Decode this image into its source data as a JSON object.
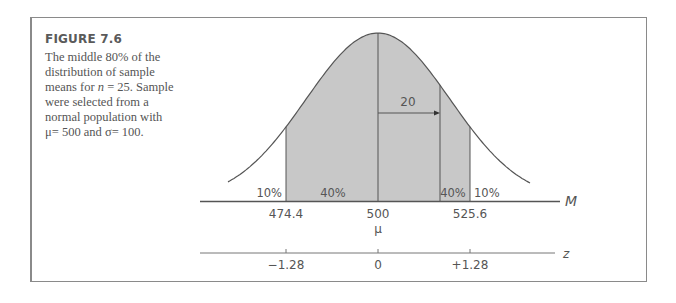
{
  "figure": {
    "title": "FIGURE 7.6",
    "caption_parts": {
      "line1": "The middle 80% of the",
      "line2": "distribution of sample",
      "line3_pre": "means for ",
      "line3_var": "n",
      "line3_post": " = 25. Sample",
      "line4": "were selected from a",
      "line5": "normal population with",
      "line6": "μ= 500 and σ= 100."
    }
  },
  "chart_data": {
    "type": "area",
    "distribution": {
      "mean": 500,
      "standard_error": 20,
      "n": 25,
      "population_mu": 500,
      "population_sigma": 100
    },
    "shaded_region": {
      "from": 474.4,
      "to": 525.6,
      "percent": 80
    },
    "regions": [
      {
        "label": "10%",
        "range": "below 474.4"
      },
      {
        "label": "40%",
        "range": "474.4 to 500"
      },
      {
        "label": "40%",
        "range": "500 to 525.6"
      },
      {
        "label": "10%",
        "range": "above 525.6"
      }
    ],
    "annotation": {
      "label": "20",
      "meaning": "arrow from mean to one standard error"
    },
    "axes": [
      {
        "name": "M",
        "ticks": [
          "474.4",
          "500",
          "525.6"
        ],
        "mean_symbol": "μ"
      },
      {
        "name": "z",
        "ticks": [
          "−1.28",
          "0",
          "+1.28"
        ]
      }
    ]
  },
  "labels": {
    "tail_left": "10%",
    "mid_left": "40%",
    "mid_right": "40%",
    "tail_right": "10%",
    "arrow": "20",
    "m_axis": "M",
    "z_axis": "z",
    "m_ticks": [
      "474.4",
      "500",
      "525.6"
    ],
    "mu": "μ",
    "z_ticks": [
      "−1.28",
      "0",
      "+1.28"
    ]
  },
  "colors": {
    "shade": "#c8c8c8",
    "line": "#555555",
    "frame": "#8a8a8a"
  }
}
